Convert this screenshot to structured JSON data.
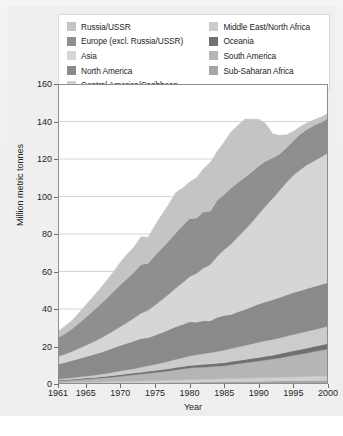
{
  "chart_data": {
    "type": "area",
    "stacked": true,
    "title": "",
    "xlabel": "Year",
    "ylabel": "Million metric tonnes",
    "xlim": [
      1961,
      2000
    ],
    "ylim": [
      0,
      160
    ],
    "ytick_values": [
      0,
      20,
      40,
      60,
      80,
      100,
      120,
      140,
      160
    ],
    "ytick_labels": [
      "0",
      "20",
      "40",
      "60",
      "80",
      "100",
      "120",
      "140",
      "160"
    ],
    "xtick_values": [
      1961,
      1965,
      1970,
      1975,
      1980,
      1985,
      1990,
      1995,
      2000
    ],
    "xtick_labels": [
      "1961",
      "1965",
      "1970",
      "1975",
      "1980",
      "1985",
      "1990",
      "1995",
      "2000"
    ],
    "grid": "horizontal",
    "legend_position": "top",
    "legend_columns": 2,
    "x": [
      1961,
      1962,
      1963,
      1964,
      1965,
      1966,
      1967,
      1968,
      1969,
      1970,
      1971,
      1972,
      1973,
      1974,
      1975,
      1976,
      1977,
      1978,
      1979,
      1980,
      1981,
      1982,
      1983,
      1984,
      1985,
      1986,
      1987,
      1988,
      1989,
      1990,
      1991,
      1992,
      1993,
      1994,
      1995,
      1996,
      1997,
      1998,
      1999,
      2000
    ],
    "series": [
      {
        "name": "Sub-Saharan Africa",
        "color": "#a6a6a6",
        "values": [
          0.3,
          0.3,
          0.3,
          0.4,
          0.4,
          0.4,
          0.4,
          0.5,
          0.5,
          0.5,
          0.6,
          0.6,
          0.6,
          0.7,
          0.7,
          0.8,
          0.8,
          0.9,
          0.9,
          1.0,
          1.0,
          1.1,
          1.1,
          1.2,
          1.2,
          1.3,
          1.3,
          1.4,
          1.4,
          1.5,
          1.5,
          1.6,
          1.6,
          1.7,
          1.7,
          1.8,
          1.8,
          1.9,
          1.9,
          2.0
        ]
      },
      {
        "name": "Central America/Caribbean",
        "color": "#d0d0d0",
        "values": [
          0.4,
          0.4,
          0.5,
          0.5,
          0.6,
          0.6,
          0.7,
          0.7,
          0.8,
          0.8,
          0.9,
          0.9,
          1.0,
          1.0,
          1.1,
          1.1,
          1.2,
          1.2,
          1.3,
          1.3,
          1.4,
          1.4,
          1.5,
          1.5,
          1.6,
          1.6,
          1.7,
          1.7,
          1.8,
          1.8,
          1.9,
          1.9,
          2.0,
          2.0,
          2.1,
          2.1,
          2.2,
          2.2,
          2.3,
          2.3
        ]
      },
      {
        "name": "South America",
        "color": "#b5b5b5",
        "values": [
          1.0,
          1.1,
          1.2,
          1.4,
          1.6,
          1.8,
          2.0,
          2.2,
          2.5,
          2.8,
          3.1,
          3.4,
          3.7,
          4.0,
          4.3,
          4.6,
          5.0,
          5.4,
          5.8,
          6.2,
          6.4,
          6.5,
          6.6,
          6.8,
          7.0,
          7.4,
          7.8,
          8.2,
          8.6,
          9.0,
          9.4,
          9.8,
          10.3,
          10.9,
          11.5,
          12.0,
          12.6,
          13.2,
          13.8,
          14.4
        ]
      },
      {
        "name": "Oceania",
        "color": "#707070",
        "values": [
          0.4,
          0.4,
          0.5,
          0.5,
          0.6,
          0.6,
          0.7,
          0.7,
          0.8,
          0.9,
          0.9,
          1.0,
          1.0,
          1.1,
          1.1,
          1.2,
          1.2,
          1.3,
          1.3,
          1.4,
          1.4,
          1.5,
          1.5,
          1.6,
          1.6,
          1.7,
          1.7,
          1.8,
          1.8,
          1.9,
          2.0,
          2.1,
          2.2,
          2.3,
          2.4,
          2.5,
          2.6,
          2.7,
          2.8,
          2.9
        ]
      },
      {
        "name": "Middle East/North Africa",
        "color": "#cccccc",
        "values": [
          0.6,
          0.7,
          0.8,
          0.9,
          1.0,
          1.2,
          1.3,
          1.5,
          1.7,
          1.9,
          2.1,
          2.3,
          2.6,
          2.9,
          3.2,
          3.5,
          3.9,
          4.3,
          4.7,
          5.1,
          5.4,
          5.7,
          6.0,
          6.3,
          6.6,
          6.9,
          7.2,
          7.5,
          7.8,
          8.1,
          8.3,
          8.4,
          8.5,
          8.6,
          8.7,
          8.8,
          8.9,
          9.0,
          9.1,
          9.2
        ]
      },
      {
        "name": "North America",
        "color": "#8a8a8a",
        "values": [
          8.0,
          8.6,
          9.2,
          9.8,
          10.4,
          11.0,
          11.6,
          12.3,
          13.0,
          13.6,
          14.2,
          14.8,
          15.4,
          15.0,
          15.6,
          16.2,
          16.8,
          17.4,
          17.8,
          18.2,
          17.4,
          17.6,
          17.0,
          18.2,
          18.6,
          18.2,
          18.8,
          19.2,
          19.8,
          20.4,
          20.8,
          21.2,
          21.6,
          22.0,
          22.4,
          22.6,
          22.8,
          23.0,
          23.2,
          23.4
        ]
      },
      {
        "name": "Asia",
        "color": "#d6d6d6",
        "values": [
          4.0,
          4.4,
          4.8,
          5.4,
          6.0,
          6.7,
          7.4,
          8.2,
          9.0,
          10.0,
          11.0,
          12.2,
          13.4,
          14.6,
          16.0,
          17.5,
          19.0,
          20.6,
          22.2,
          24.0,
          26.0,
          28.0,
          30.0,
          32.5,
          35.0,
          37.5,
          40.0,
          42.5,
          45.0,
          48.0,
          51.0,
          54.0,
          57.0,
          60.0,
          62.5,
          64.5,
          66.0,
          67.0,
          68.0,
          69.0
        ]
      },
      {
        "name": "Europe (excl. Russia/USSR)",
        "color": "#8f8f8f",
        "values": [
          10.0,
          11.0,
          12.0,
          13.5,
          15.0,
          16.5,
          18.0,
          19.5,
          21.0,
          22.5,
          23.5,
          24.5,
          26.0,
          25.0,
          26.5,
          27.5,
          28.5,
          29.5,
          30.5,
          31.0,
          29.5,
          30.0,
          28.5,
          30.0,
          29.5,
          30.0,
          29.0,
          28.0,
          27.0,
          25.5,
          24.0,
          21.5,
          19.5,
          18.5,
          18.5,
          19.0,
          19.0,
          19.0,
          18.5,
          18.5
        ]
      },
      {
        "name": "Russia/USSR",
        "color": "#c4c4c4",
        "values": [
          3.5,
          4.0,
          4.5,
          5.5,
          6.5,
          7.5,
          8.5,
          9.5,
          10.5,
          12.0,
          13.0,
          13.5,
          15.0,
          14.0,
          16.0,
          18.0,
          19.5,
          21.5,
          20.0,
          19.5,
          21.5,
          23.0,
          26.0,
          26.0,
          28.0,
          30.0,
          30.5,
          31.0,
          28.0,
          25.0,
          20.0,
          13.0,
          10.0,
          7.0,
          5.0,
          4.0,
          3.5,
          3.0,
          2.8,
          2.6
        ]
      }
    ],
    "totals_note": "Stacked total peaks near 146 around 1988-1989 and ends near 144 in 2000."
  },
  "axes": {
    "ylabel": "Million metric tonnes",
    "xlabel": "Year"
  },
  "legend": {
    "left_column": [
      {
        "label": "Russia/USSR",
        "color": "#c4c4c4"
      },
      {
        "label": "Europe (excl. Russia/USSR)",
        "color": "#8f8f8f"
      },
      {
        "label": "Asia",
        "color": "#d6d6d6"
      },
      {
        "label": "North America",
        "color": "#8a8a8a"
      },
      {
        "label": "Central America/Caribbean",
        "color": "#d0d0d0"
      }
    ],
    "right_column": [
      {
        "label": "Middle East/North Africa",
        "color": "#cccccc"
      },
      {
        "label": "Oceania",
        "color": "#707070"
      },
      {
        "label": "South America",
        "color": "#b5b5b5"
      },
      {
        "label": "Sub-Saharan Africa",
        "color": "#a6a6a6"
      }
    ]
  }
}
